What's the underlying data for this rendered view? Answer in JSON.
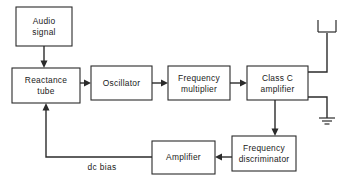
{
  "diagram": {
    "stroke_color": "#2b2b2b",
    "background_color": "#ffffff",
    "blocks": [
      {
        "id": "audio-signal",
        "line1": "Audio",
        "line2": "signal"
      },
      {
        "id": "reactance-tube",
        "line1": "Reactance",
        "line2": "tube"
      },
      {
        "id": "oscillator",
        "line1": "Oscillator",
        "line2": ""
      },
      {
        "id": "frequency-multiplier",
        "line1": "Frequency",
        "line2": "multiplier"
      },
      {
        "id": "class-c-amplifier",
        "line1": "Class C",
        "line2": "amplifier"
      },
      {
        "id": "frequency-discriminator",
        "line1": "Frequency",
        "line2": "discriminator"
      },
      {
        "id": "amplifier",
        "line1": "Amplifier",
        "line2": ""
      }
    ],
    "wire_labels": [
      {
        "id": "dc-bias",
        "text": "dc  bias"
      }
    ],
    "symbols": [
      {
        "id": "antenna",
        "name": "antenna-symbol"
      },
      {
        "id": "ground",
        "name": "ground-symbol"
      }
    ]
  }
}
